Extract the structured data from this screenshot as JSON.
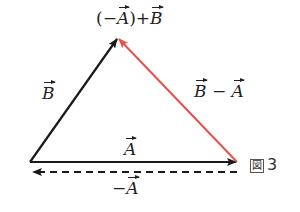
{
  "diagram": {
    "title_label": {
      "prefix": "(−",
      "vec1": "A",
      "mid": ")+",
      "vec2": "B"
    },
    "labels": {
      "B": {
        "vec": "B"
      },
      "B_minus_A": {
        "vec1": "B",
        "op": " − ",
        "vec2": "A"
      },
      "A": {
        "vec": "A"
      },
      "neg_A": {
        "op": "−",
        "vec": "A"
      }
    },
    "figure_caption": {
      "box_glyph": "図",
      "number": "3"
    },
    "colors": {
      "black_vector": "#1a1a1a",
      "red_vector": "#e8504a",
      "dashed_vector": "#1a1a1a"
    },
    "vertices": {
      "origin": [
        30,
        162
      ],
      "apex": [
        118,
        38
      ],
      "right": [
        237,
        162
      ]
    }
  }
}
